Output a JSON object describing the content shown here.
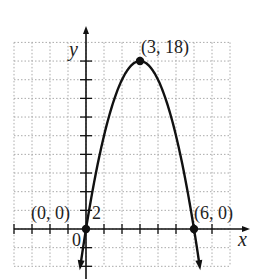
{
  "chart_data": {
    "type": "line",
    "title": "",
    "xlabel": "x",
    "ylabel": "y",
    "function": "y = -2x^2 + 12x",
    "xlim": [
      -4,
      8
    ],
    "ylim": [
      -4,
      20
    ],
    "x_tick_step": 1,
    "y_tick_step": 2,
    "grid": true,
    "grid_style": "dotted",
    "y_tick_label": "2",
    "origin_label": "0",
    "points": [
      {
        "x": 0,
        "y": 0,
        "label": "(0, 0)"
      },
      {
        "x": 3,
        "y": 18,
        "label": "(3, 18)"
      },
      {
        "x": 6,
        "y": 0,
        "label": "(6, 0)"
      }
    ],
    "series": [
      {
        "name": "parabola",
        "x": [
          -0.2,
          0,
          0.5,
          1,
          1.5,
          2,
          2.5,
          3,
          3.5,
          4,
          4.5,
          5,
          5.5,
          6,
          6.2
        ],
        "values": [
          -2.48,
          0,
          5.5,
          10,
          13.5,
          16,
          17.5,
          18,
          17.5,
          16,
          13.5,
          10,
          5.5,
          0,
          -2.48
        ]
      }
    ],
    "colors": {
      "curve": "#111111",
      "grid": "#aaaaaa",
      "axis": "#111111"
    }
  }
}
